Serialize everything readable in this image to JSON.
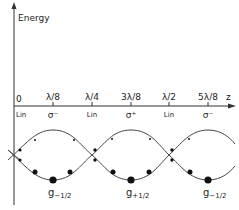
{
  "diagram": {
    "y_axis_label": "Energy",
    "z_axis_label": "z",
    "origin_label": "0",
    "ticks": [
      {
        "label": "λ/8",
        "polarization": "σ⁻"
      },
      {
        "label": "λ/4",
        "polarization": "Lin"
      },
      {
        "label": "3λ/8",
        "polarization": "σ⁺"
      },
      {
        "label": "λ/2",
        "polarization": "Lin"
      },
      {
        "label": "5λ/8",
        "polarization": "σ⁻"
      }
    ],
    "origin_polarization": "Lin",
    "ground_states": [
      {
        "label": "g",
        "sub": "−1/2"
      },
      {
        "label": "g",
        "sub": "+1/2"
      },
      {
        "label": "g",
        "sub": "−1/2"
      }
    ]
  }
}
